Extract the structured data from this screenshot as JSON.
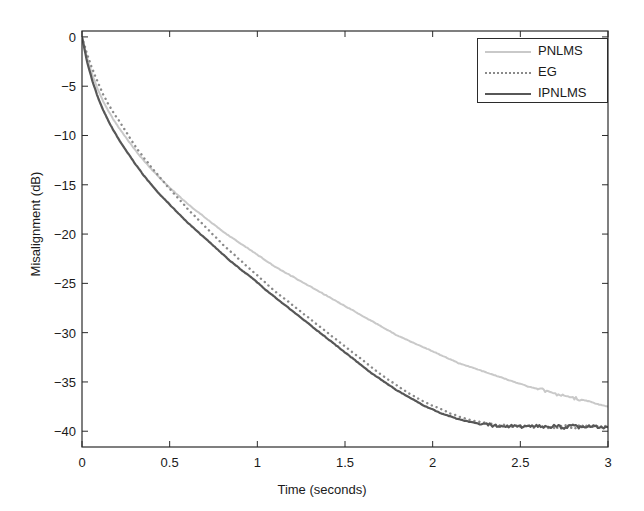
{
  "chart_data": {
    "type": "line",
    "title": "",
    "xlabel": "Time (seconds)",
    "ylabel": "Misalignment (dB)",
    "xlim": [
      0,
      3
    ],
    "ylim": [
      -41.6,
      0.6
    ],
    "xticks": [
      0,
      0.5,
      1,
      1.5,
      2,
      2.5,
      3
    ],
    "xticklabels": [
      "0",
      "0.5",
      "1",
      "1.5",
      "2",
      "2.5",
      "3"
    ],
    "yticks": [
      0,
      -5,
      -10,
      -15,
      -20,
      -25,
      -30,
      -35,
      -40
    ],
    "yticklabels": [
      "0",
      "−5",
      "−10",
      "−15",
      "−20",
      "−25",
      "−30",
      "−35",
      "−40"
    ],
    "grid": false,
    "legend_position": "upper right",
    "x": [
      0,
      0.03,
      0.06,
      0.09,
      0.12,
      0.15,
      0.18,
      0.21,
      0.25,
      0.3,
      0.35,
      0.4,
      0.45,
      0.5,
      0.55,
      0.6,
      0.65,
      0.7,
      0.75,
      0.8,
      0.85,
      0.9,
      0.95,
      1.0,
      1.05,
      1.1,
      1.15,
      1.2,
      1.25,
      1.3,
      1.35,
      1.4,
      1.45,
      1.5,
      1.55,
      1.6,
      1.65,
      1.7,
      1.75,
      1.8,
      1.85,
      1.9,
      1.95,
      2.0,
      2.05,
      2.1,
      2.15,
      2.2,
      2.25,
      2.3,
      2.35,
      2.4,
      2.45,
      2.5,
      2.55,
      2.6,
      2.65,
      2.7,
      2.75,
      2.8,
      2.85,
      2.9,
      2.95,
      3.0
    ],
    "series": [
      {
        "name": "PNLMS",
        "color": "#c9c9c9",
        "linestyle": "solid",
        "linewidth": 2.0,
        "values": [
          0,
          -2.2,
          -3.9,
          -5.3,
          -6.5,
          -7.5,
          -8.4,
          -9.2,
          -10.2,
          -11.4,
          -12.5,
          -13.5,
          -14.4,
          -15.3,
          -16.1,
          -16.9,
          -17.6,
          -18.3,
          -19.0,
          -19.7,
          -20.3,
          -20.9,
          -21.5,
          -22.1,
          -22.7,
          -23.3,
          -23.8,
          -24.3,
          -24.8,
          -25.3,
          -25.8,
          -26.3,
          -26.8,
          -27.3,
          -27.8,
          -28.3,
          -28.8,
          -29.3,
          -29.8,
          -30.3,
          -30.7,
          -31.1,
          -31.5,
          -31.9,
          -32.3,
          -32.7,
          -33.1,
          -33.4,
          -33.7,
          -34.0,
          -34.3,
          -34.6,
          -34.9,
          -35.2,
          -35.5,
          -35.7,
          -35.9,
          -36.2,
          -36.4,
          -36.6,
          -36.8,
          -37.0,
          -37.3,
          -37.5
        ]
      },
      {
        "name": "EG",
        "color": "#8a8a8a",
        "linestyle": "dotted",
        "linewidth": 2.0,
        "values": [
          0,
          -1.8,
          -3.3,
          -4.6,
          -5.8,
          -6.8,
          -7.7,
          -8.5,
          -9.6,
          -11.0,
          -12.2,
          -13.3,
          -14.4,
          -15.4,
          -16.4,
          -17.4,
          -18.3,
          -19.2,
          -20.1,
          -21.0,
          -21.8,
          -22.6,
          -23.4,
          -24.2,
          -25.0,
          -25.8,
          -26.5,
          -27.2,
          -27.9,
          -28.6,
          -29.3,
          -30.0,
          -30.7,
          -31.4,
          -32.1,
          -32.8,
          -33.5,
          -34.2,
          -34.8,
          -35.4,
          -36.0,
          -36.5,
          -37.0,
          -37.4,
          -37.8,
          -38.2,
          -38.5,
          -38.8,
          -39.0,
          -39.2,
          -39.3,
          -39.4,
          -39.5,
          -39.5,
          -39.5,
          -39.6,
          -39.5,
          -39.6,
          -39.5,
          -39.6,
          -39.5,
          -39.6,
          -39.5,
          -39.6
        ]
      },
      {
        "name": "IPNLMS",
        "color": "#575757",
        "linestyle": "solid",
        "linewidth": 2.2,
        "values": [
          0,
          -2.6,
          -4.5,
          -6.1,
          -7.4,
          -8.5,
          -9.5,
          -10.4,
          -11.5,
          -12.8,
          -14.0,
          -15.1,
          -16.1,
          -17.0,
          -17.9,
          -18.8,
          -19.6,
          -20.4,
          -21.2,
          -22.0,
          -22.8,
          -23.5,
          -24.2,
          -24.9,
          -25.7,
          -26.4,
          -27.1,
          -27.8,
          -28.5,
          -29.2,
          -29.9,
          -30.6,
          -31.3,
          -32.0,
          -32.7,
          -33.4,
          -34.1,
          -34.7,
          -35.3,
          -35.9,
          -36.4,
          -36.9,
          -37.4,
          -37.8,
          -38.2,
          -38.5,
          -38.8,
          -39.0,
          -39.2,
          -39.3,
          -39.4,
          -39.5,
          -39.5,
          -39.5,
          -39.6,
          -39.5,
          -39.6,
          -39.5,
          -39.6,
          -39.5,
          -39.6,
          -39.5,
          -39.6,
          -39.6
        ]
      }
    ]
  },
  "legend": {
    "entries": [
      {
        "label": "PNLMS"
      },
      {
        "label": "EG"
      },
      {
        "label": "IPNLMS"
      }
    ]
  },
  "axes": {
    "frame_color": "#2b2b2b"
  }
}
